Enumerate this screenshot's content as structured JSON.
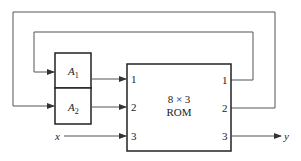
{
  "diagram": {
    "registers": [
      {
        "name": "A",
        "subscript": "1"
      },
      {
        "name": "A",
        "subscript": "2"
      }
    ],
    "rom": {
      "line1": "8 × 3",
      "line2": "ROM",
      "inputs": [
        "1",
        "2",
        "3"
      ],
      "outputs": [
        "1",
        "2",
        "3"
      ]
    },
    "external_input": "x",
    "external_output": "y",
    "colors": {
      "line": "#555555",
      "box": "#222222",
      "background": "#ffffff"
    }
  }
}
